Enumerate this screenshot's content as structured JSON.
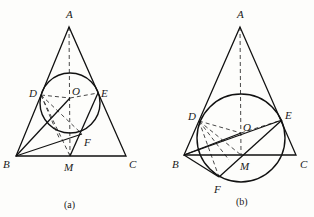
{
  "figures": [
    {
      "id": "a",
      "caption": "(a)",
      "points": {
        "A": {
          "label": "A",
          "x": 69,
          "y": 27
        },
        "B": {
          "label": "B",
          "x": 16,
          "y": 156
        },
        "C": {
          "label": "C",
          "x": 126,
          "y": 156
        },
        "M": {
          "label": "M",
          "x": 70,
          "y": 156
        },
        "D": {
          "label": "D",
          "x": 41,
          "y": 95
        },
        "E": {
          "label": "E",
          "x": 98,
          "y": 93
        },
        "O": {
          "label": "O",
          "x": 70,
          "y": 98
        },
        "F": {
          "label": "F",
          "x": 82,
          "y": 134
        }
      },
      "circle": {
        "cx": 70,
        "cy": 103,
        "r": 30
      },
      "solid_segments": [
        [
          "A",
          "B"
        ],
        [
          "A",
          "C"
        ],
        [
          "B",
          "C"
        ],
        [
          "B",
          "O"
        ],
        [
          "B",
          "F"
        ],
        [
          "M",
          "E"
        ]
      ],
      "dashed_segments": [
        [
          "A",
          "M"
        ],
        [
          "D",
          "O"
        ],
        [
          "O",
          "E"
        ],
        [
          "D",
          "M"
        ],
        [
          "D",
          "F"
        ]
      ]
    },
    {
      "id": "b",
      "caption": "(b)",
      "points": {
        "A": {
          "label": "A",
          "x": 240,
          "y": 27
        },
        "B": {
          "label": "B",
          "x": 184,
          "y": 155
        },
        "C": {
          "label": "C",
          "x": 296,
          "y": 155
        },
        "M": {
          "label": "M",
          "x": 241,
          "y": 155
        },
        "D": {
          "label": "D",
          "x": 199,
          "y": 121
        },
        "E": {
          "label": "E",
          "x": 282,
          "y": 120
        },
        "O": {
          "label": "O",
          "x": 241,
          "y": 133
        },
        "F": {
          "label": "F",
          "x": 219,
          "y": 177
        }
      },
      "circle": {
        "cx": 241,
        "cy": 138,
        "r": 44
      },
      "solid_segments": [
        [
          "A",
          "B"
        ],
        [
          "A",
          "C"
        ],
        [
          "B",
          "C"
        ],
        [
          "B",
          "O"
        ],
        [
          "B",
          "E"
        ],
        [
          "B",
          "F"
        ],
        [
          "F",
          "E"
        ]
      ],
      "dashed_segments": [
        [
          "A",
          "M"
        ],
        [
          "D",
          "O"
        ],
        [
          "O",
          "E"
        ],
        [
          "D",
          "M"
        ],
        [
          "D",
          "F"
        ]
      ]
    }
  ],
  "labels": {
    "a": {
      "A": "A",
      "B": "B",
      "C": "C",
      "D": "D",
      "E": "E",
      "F": "F",
      "M": "M",
      "O": "O",
      "caption": "(a)"
    },
    "b": {
      "A": "A",
      "B": "B",
      "C": "C",
      "D": "D",
      "E": "E",
      "F": "F",
      "M": "M",
      "O": "O",
      "caption": "(b)"
    }
  }
}
